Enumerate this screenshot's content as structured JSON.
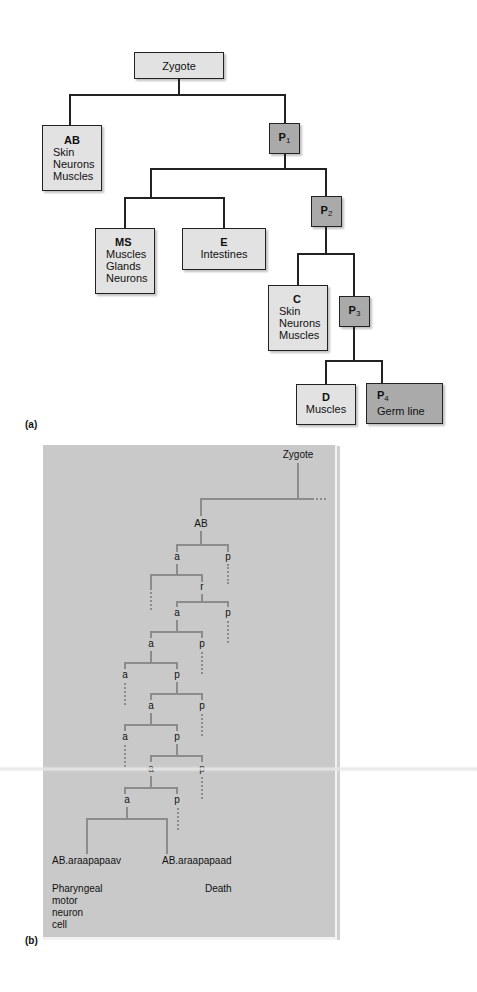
{
  "panel_a": {
    "label": "(a)",
    "nodes": {
      "zygote": {
        "title": "Zygote"
      },
      "ab": {
        "title": "AB",
        "fates": [
          "Skin",
          "Neurons",
          "Muscles"
        ]
      },
      "p1": {
        "title": "P",
        "sub": "1"
      },
      "ms": {
        "title": "MS",
        "fates": [
          "Muscles",
          "Glands",
          "Neurons"
        ]
      },
      "e": {
        "title": "E",
        "fates": [
          "Intestines"
        ]
      },
      "p2": {
        "title": "P",
        "sub": "2"
      },
      "c": {
        "title": "C",
        "fates": [
          "Skin",
          "Neurons",
          "Muscles"
        ]
      },
      "p3": {
        "title": "P",
        "sub": "3"
      },
      "d": {
        "title": "D",
        "fates": [
          "Muscles"
        ]
      },
      "p4": {
        "title": "P",
        "sub": "4",
        "fates": [
          "Germ line"
        ]
      }
    },
    "colors": {
      "light_box": "#e2e2e2",
      "dark_box": "#aaaaaa",
      "line": "#222222"
    }
  },
  "panel_b": {
    "label": "(b)",
    "root": "Zygote",
    "ab": "AB",
    "lineage_labels": [
      "a",
      "p",
      "r",
      "a",
      "p",
      "a",
      "p",
      "a",
      "p",
      "a",
      "p",
      "a",
      "p",
      "a",
      "p",
      "a",
      "p"
    ],
    "leaves": [
      {
        "name": "AB.araapapaav",
        "fate": [
          "Pharyngeal",
          "motor",
          "neuron",
          "cell"
        ]
      },
      {
        "name": "AB.araapapaad",
        "fate": [
          "Death"
        ]
      }
    ],
    "colors": {
      "background": "#c9c9c9",
      "line": "#8c8c8c"
    }
  }
}
